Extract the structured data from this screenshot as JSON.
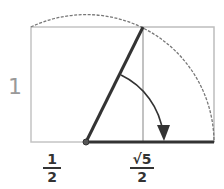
{
  "diagram": {
    "type": "golden-ratio-construction",
    "labels": {
      "height": "1",
      "half_numerator": "1",
      "half_denominator": "2",
      "root_numerator": "√5",
      "root_denominator": "2"
    },
    "colors": {
      "square_stroke": "#bdbdbd",
      "arc_stroke": "#666666",
      "main_stroke": "#333333",
      "label_light": "#999999"
    }
  }
}
